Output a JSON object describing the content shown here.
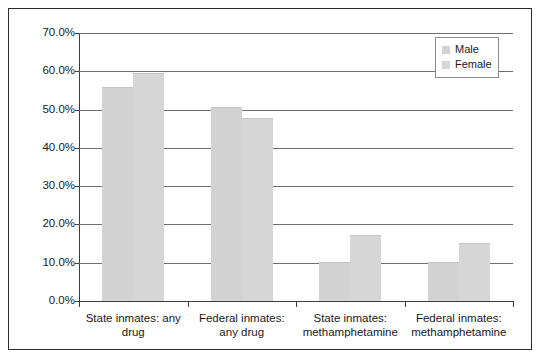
{
  "chart_data": {
    "type": "bar",
    "title": "",
    "subtitle": "",
    "xlabel": "",
    "ylabel": "",
    "ylim": [
      0,
      70
    ],
    "y_tick_labels": [
      "70.0%",
      "60.0%",
      "50.0%",
      "40.0%",
      "30.0%",
      "20.0%",
      "10.0%",
      "0.0%"
    ],
    "y_tick_values": [
      70,
      60,
      50,
      40,
      30,
      20,
      10,
      0
    ],
    "grid": true,
    "legend_position": "top-right",
    "categories": [
      "State inmates: any drug",
      "Federal inmates: any drug",
      "State inmates: methamphetamine",
      "Federal inmates: methamphetamine"
    ],
    "category_lines": [
      [
        "State inmates: any",
        "drug"
      ],
      [
        "Federal inmates:",
        "any drug"
      ],
      [
        "State inmates:",
        "methamphetamine"
      ],
      [
        "Federal inmates:",
        "methamphetamine"
      ]
    ],
    "series": [
      {
        "name": "Male",
        "color": "#d2d2d2",
        "values": [
          55.9,
          50.7,
          10.1,
          10.2
        ]
      },
      {
        "name": "Female",
        "color": "#d6d6d6",
        "values": [
          59.5,
          47.7,
          17.2,
          15.2
        ]
      }
    ]
  },
  "legend": {
    "items": [
      {
        "label": "Male"
      },
      {
        "label": "Female"
      }
    ]
  }
}
